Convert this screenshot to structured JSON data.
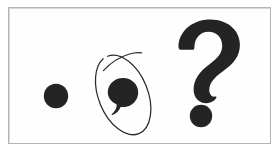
{
  "figure": {
    "background_color": "#ffffff",
    "panel_color": "#fefefe",
    "border_color": "#b4b4b4",
    "ink_color": "#1f1f1f",
    "annotation_color": "#2b2b2b",
    "caption": ""
  },
  "marks": [
    {
      "id": "period",
      "name": "period",
      "character": ".",
      "label": "period",
      "annotated": false,
      "center": {
        "x": 56,
        "y": 96
      },
      "radius": 12
    },
    {
      "id": "comma",
      "name": "comma",
      "character": ",",
      "label": "comma",
      "annotated": true,
      "annotation": {
        "type": "hand-drawn-ellipse",
        "name": "circled-annotation",
        "center": {
          "x": 123,
          "y": 95
        },
        "radius_x": 25,
        "radius_y": 42,
        "rotation_deg": -22,
        "stroke_width": 1.2,
        "has_overshoot_tail": true
      },
      "center": {
        "x": 123,
        "y": 92
      },
      "radius": 14
    },
    {
      "id": "question-mark",
      "name": "question-mark",
      "character": "?",
      "label": "question mark",
      "annotated": false,
      "bounds": {
        "x": 176,
        "y": 18,
        "width": 64,
        "height": 110
      },
      "dot": {
        "center": {
          "x": 199,
          "y": 115
        },
        "radius": 11
      }
    }
  ]
}
